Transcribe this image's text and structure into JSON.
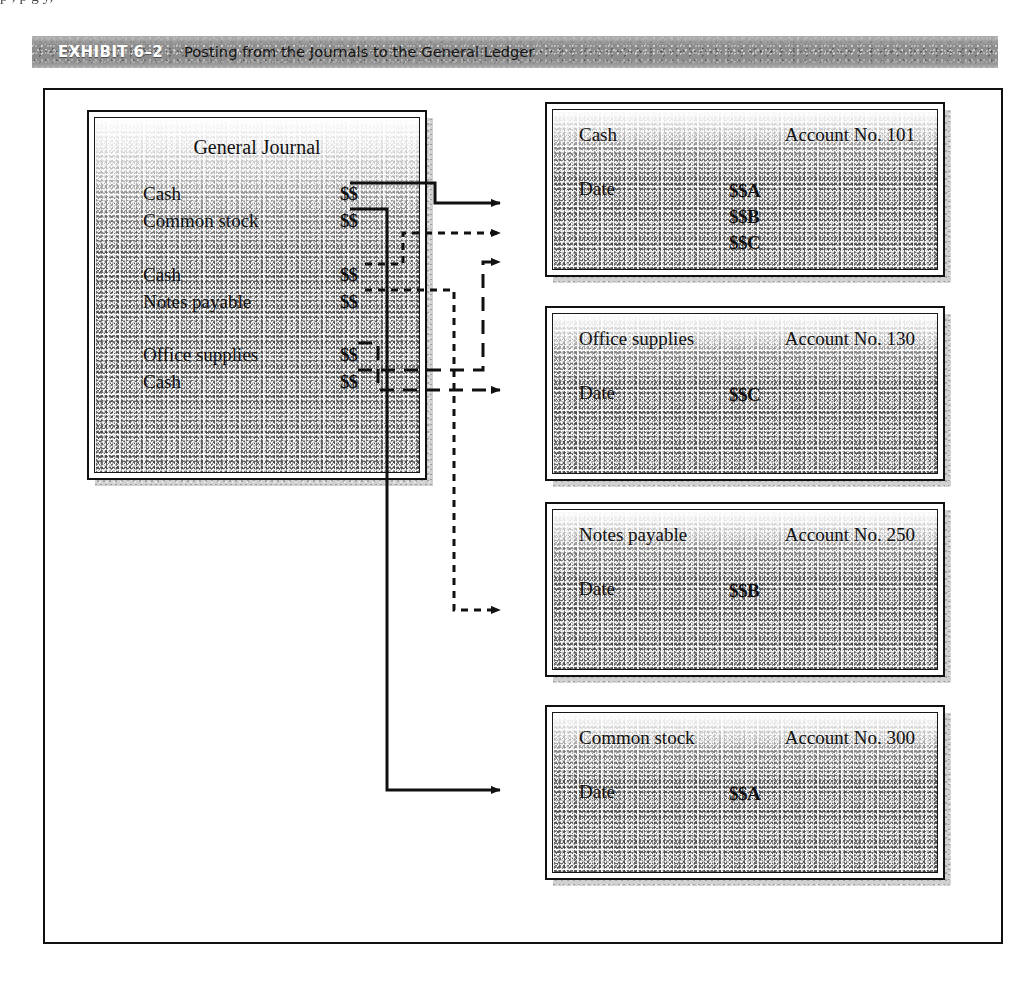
{
  "page": {
    "top_text_fragment": "p       ,                                                                                                                                  p        g        y,"
  },
  "exhibit": {
    "label": "EXHIBIT 6–2",
    "title": "Posting from the Journals to the General Ledger"
  },
  "journal": {
    "title": "General Journal",
    "entries": [
      {
        "account": "Cash",
        "amount": "$$"
      },
      {
        "account": "Common stock",
        "amount": "$$"
      },
      {
        "account": "Cash",
        "amount": "$$"
      },
      {
        "account": "Notes payable",
        "amount": "$$"
      },
      {
        "account": "Office supplies",
        "amount": "$$"
      },
      {
        "account": "Cash",
        "amount": "$$"
      }
    ]
  },
  "ledger_accounts": [
    {
      "name": "Cash",
      "account_no": "Account No. 101",
      "date_label": "Date",
      "values": [
        "$$A",
        "$$B",
        "$$C"
      ]
    },
    {
      "name": "Office supplies",
      "account_no": "Account No. 130",
      "date_label": "Date",
      "values": [
        "$$C"
      ]
    },
    {
      "name": "Notes payable",
      "account_no": "Account No. 250",
      "date_label": "Date",
      "values": [
        "$$B"
      ]
    },
    {
      "name": "Common stock",
      "account_no": "Account No. 300",
      "date_label": "Date",
      "values": [
        "$$A"
      ]
    }
  ],
  "connectors": [
    {
      "from": "journal-cash-1",
      "to": "ledger-cash",
      "style": "solid"
    },
    {
      "from": "journal-common-stock",
      "to": "ledger-stock",
      "style": "solid"
    },
    {
      "from": "journal-cash-2",
      "to": "ledger-cash",
      "style": "dotted"
    },
    {
      "from": "journal-notes-payable",
      "to": "ledger-notes",
      "style": "dotted"
    },
    {
      "from": "journal-office-supplies",
      "to": "ledger-supplies",
      "style": "dashed"
    },
    {
      "from": "journal-cash-3",
      "to": "ledger-cash",
      "style": "dashed"
    }
  ],
  "colors": {
    "ink": "#111111",
    "header_bar": "#8d8d8d",
    "header_label_text": "#ffffff",
    "paper_texture": "#b9b9b9"
  }
}
